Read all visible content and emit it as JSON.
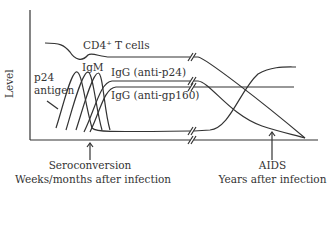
{
  "diagram": {
    "y_axis_label": "Level",
    "labels": {
      "cd4": "CD4⁺ T cells",
      "p24_line1": "p24",
      "p24_line2": "antigen",
      "igm": "IgM",
      "igg_p24": "IgG (anti-p24)",
      "igg_gp160": "IgG (anti-gp160)"
    },
    "annotations": {
      "seroconversion": "Seroconversion",
      "early_time": "Weeks/months after infection",
      "aids": "AIDS",
      "late_time": "Years after infection"
    },
    "colors": {
      "line": "#333333",
      "background": "#ffffff"
    }
  }
}
